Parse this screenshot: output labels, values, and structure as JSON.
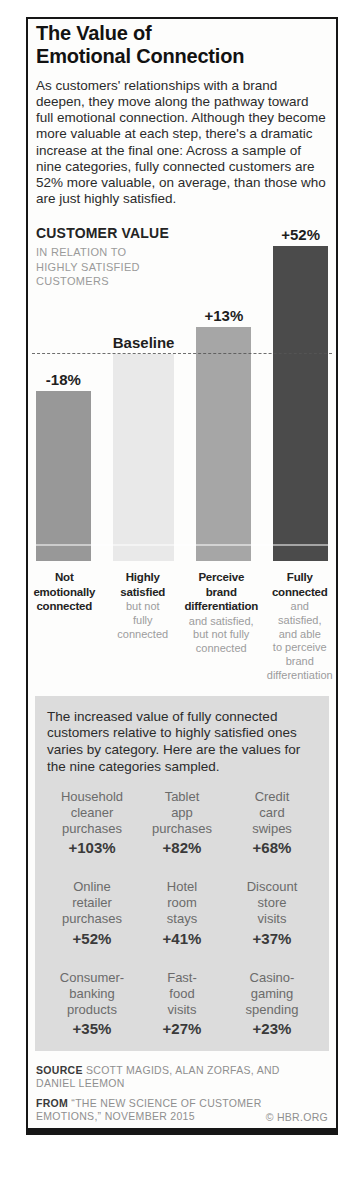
{
  "poster": {
    "title": "The Value of\nEmotional Connection",
    "intro": "As customers' relationships with a brand deepen, they move along the pathway toward full emotional connection. Although they become more valuable at each step, there's a dramatic increase at the final one: Across a sample of nine categories, fully connected customers are 52% more valuable, on average, than those who are just highly satisfied."
  },
  "chart_data": {
    "type": "bar",
    "title": "CUSTOMER VALUE",
    "subtitle": "IN RELATION TO\nHIGHLY SATISFIED\nCUSTOMERS",
    "categories": [
      "Not emotionally connected",
      "Highly satisfied",
      "Perceive brand differentiation",
      "Fully connected"
    ],
    "values": [
      82,
      100,
      113,
      152
    ],
    "value_labels": [
      "-18%",
      "Baseline",
      "+13%",
      "+52%"
    ],
    "baseline": 100,
    "ylim": [
      0,
      160
    ],
    "grid": false,
    "bars": [
      {
        "label": "-18%",
        "value": 82,
        "color": "#989898",
        "category": "Not\nemotionally\nconnected",
        "category_note": ""
      },
      {
        "label": "Baseline",
        "value": 100,
        "color": "#e9e9e9",
        "category": "Highly\nsatisfied",
        "category_note": "but not\nfully\nconnected"
      },
      {
        "label": "+13%",
        "value": 113,
        "color": "#a6a6a6",
        "category": "Perceive\nbrand\ndifferentiation",
        "category_note": "and satisfied,\nbut not fully\nconnected"
      },
      {
        "label": "+52%",
        "value": 152,
        "color": "#4b4b4b",
        "category": "Fully\nconnected",
        "category_note": "and\nsatisfied,\nand able\nto perceive\nbrand\ndifferentiation"
      }
    ]
  },
  "panel": {
    "bg": "#dcdcdc",
    "text": "The increased value of fully connected customers relative to highly satisfied ones varies by category. Here are the values for the nine categories sampled.",
    "categories": [
      {
        "name": "Household\ncleaner\npurchases",
        "value": "+103%"
      },
      {
        "name": "Tablet\napp\npurchases",
        "value": "+82%"
      },
      {
        "name": "Credit\ncard\nswipes",
        "value": "+68%"
      },
      {
        "name": "Online\nretailer\npurchases",
        "value": "+52%"
      },
      {
        "name": "Hotel\nroom\nstays",
        "value": "+41%"
      },
      {
        "name": "Discount\nstore\nvisits",
        "value": "+37%"
      },
      {
        "name": "Consumer-\nbanking\nproducts",
        "value": "+35%"
      },
      {
        "name": "Fast-\nfood\nvisits",
        "value": "+27%"
      },
      {
        "name": "Casino-\ngaming\nspending",
        "value": "+23%"
      }
    ]
  },
  "footer": {
    "source_label": "SOURCE",
    "source_text": "SCOTT MAGIDS, ALAN ZORFAS, AND DANIEL LEEMON",
    "from_label": "FROM",
    "from_text": "“THE NEW SCIENCE OF CUSTOMER EMOTIONS,” NOVEMBER 2015",
    "copyright": "© HBR.ORG"
  }
}
